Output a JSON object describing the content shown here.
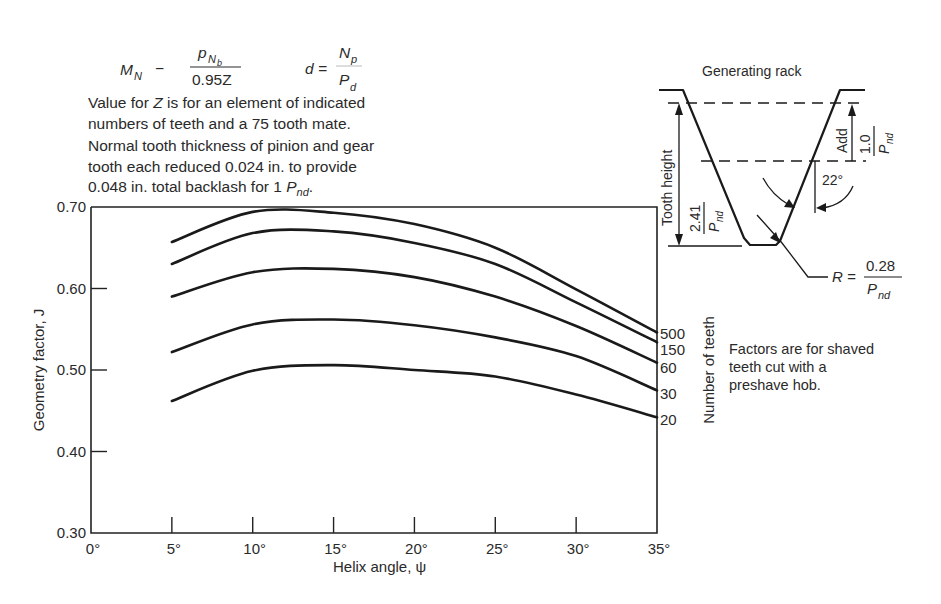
{
  "header_notes": {
    "formula_mn_lhs": "M",
    "formula_mn_lhs_sub": "N",
    "formula_mn_op": "−",
    "formula_mn_num": "p",
    "formula_mn_num_sub": "N",
    "formula_mn_num_subsub": "b",
    "formula_mn_den": "0.95Z",
    "formula_d_lhs": "d =",
    "formula_d_num": "N",
    "formula_d_num_sub": "p",
    "formula_d_den": "P",
    "formula_d_den_sub": "d",
    "line1_pre": "Value for ",
    "line1_var": "Z",
    "line1_post": " is for an element of indicated",
    "line2": "numbers of teeth and a 75 tooth mate.",
    "line3": "Normal tooth thickness of pinion and gear",
    "line4": "tooth each reduced 0.024 in. to provide",
    "line5_pre": "0.048 in. total backlash for 1 ",
    "line5_var": "P",
    "line5_sub": "nd",
    "line5_end": "."
  },
  "rack_diagram": {
    "title": "Generating rack",
    "tooth_height_label": "Tooth height",
    "tooth_height_num": "2.41",
    "tooth_height_den": "P",
    "tooth_height_den_sub": "nd",
    "add_label": "Add",
    "add_num": "1.0",
    "add_den": "P",
    "add_den_sub": "nd",
    "angle_label": "22°",
    "radius_lhs": "R =",
    "radius_num": "0.28",
    "radius_den": "P",
    "radius_den_sub": "nd"
  },
  "side_note": {
    "lines": [
      "Factors are for shaved",
      "teeth cut with a",
      "preshave hob."
    ]
  },
  "chart_data": {
    "type": "line",
    "title": "",
    "xlabel": "Helix angle, ψ",
    "ylabel": "Geometry factor, J",
    "legend_title": "Number of teeth",
    "legend_placement": "right (labels at curve ends)",
    "xlim": [
      0,
      35
    ],
    "ylim": [
      0.3,
      0.7
    ],
    "grid": false,
    "x_ticks": [
      0,
      5,
      10,
      15,
      20,
      25,
      30,
      35
    ],
    "x_tick_labels": [
      "0°",
      "5°",
      "10°",
      "15°",
      "20°",
      "25°",
      "30°",
      "35°"
    ],
    "y_ticks": [
      0.3,
      0.4,
      0.5,
      0.6,
      0.7
    ],
    "y_tick_labels": [
      "0.30",
      "0.40",
      "0.50",
      "0.60",
      "0.70"
    ],
    "x": [
      5,
      10,
      15,
      20,
      25,
      30,
      35
    ],
    "series": [
      {
        "name": "500",
        "values": [
          0.657,
          0.694,
          0.693,
          0.679,
          0.65,
          0.599,
          0.546
        ]
      },
      {
        "name": "150",
        "values": [
          0.63,
          0.668,
          0.67,
          0.656,
          0.63,
          0.583,
          0.534
        ]
      },
      {
        "name": "60",
        "values": [
          0.59,
          0.62,
          0.624,
          0.614,
          0.59,
          0.554,
          0.509
        ]
      },
      {
        "name": "30",
        "values": [
          0.522,
          0.556,
          0.562,
          0.555,
          0.54,
          0.517,
          0.475
        ]
      },
      {
        "name": "20",
        "values": [
          0.462,
          0.499,
          0.506,
          0.5,
          0.492,
          0.47,
          0.442
        ]
      }
    ]
  }
}
